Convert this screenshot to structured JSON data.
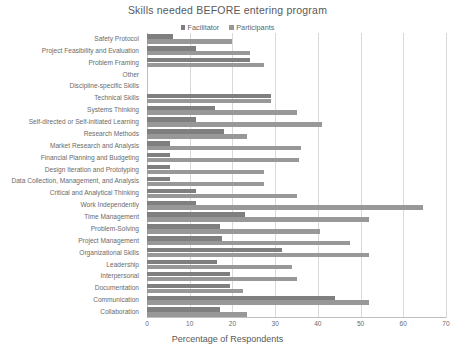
{
  "chart_data": {
    "type": "bar",
    "orientation": "horizontal",
    "title": "Skills needed BEFORE entering program",
    "xlabel": "Percentage of Respondents",
    "ylabel": "",
    "xlim": [
      0,
      70
    ],
    "xticks": [
      0,
      10,
      20,
      30,
      40,
      50,
      60,
      70
    ],
    "grid": true,
    "legend_position": "top",
    "categories": [
      "Safety Protocol",
      "Project Feasibility and Evaluation",
      "Problem Framing",
      "Other",
      "Discipline-specific Skills",
      "Technical Skills",
      "Systems Thinking",
      "Self-directed or Self-initiated Learning",
      "Research Methods",
      "Market Research and Analysis",
      "Financial Planning and Budgeting",
      "Design Iteration and Prototyping",
      "Data Collection, Management, and Analysis",
      "Critical and Analytical Thinking",
      "Work Independently",
      "Time Management",
      "Problem-Solving",
      "Project Management",
      "Organizational Skills",
      "Leadership",
      "Interpersonal",
      "Documentation",
      "Communication",
      "Collaboration"
    ],
    "series": [
      {
        "name": "Facilitator",
        "color": "#7f7f7f",
        "values": [
          6,
          11.5,
          24,
          0,
          0,
          29,
          16,
          11.5,
          18,
          5.5,
          5.5,
          5.5,
          5.5,
          11.5,
          11.5,
          23,
          17,
          17.5,
          31.5,
          16.5,
          19.5,
          19.5,
          44,
          17
        ]
      },
      {
        "name": "Participants",
        "color": "#989898",
        "values": [
          20,
          24,
          27.5,
          0,
          0,
          29,
          35,
          41,
          23.5,
          36,
          35.5,
          27.5,
          27.5,
          35,
          64.5,
          52,
          40.5,
          47.5,
          52,
          34,
          35,
          22.5,
          52,
          23.5
        ]
      }
    ]
  },
  "legend": {
    "items": [
      {
        "label": "Facilitator",
        "color": "#7f7f7f"
      },
      {
        "label": "Participants",
        "color": "#989898"
      }
    ]
  }
}
